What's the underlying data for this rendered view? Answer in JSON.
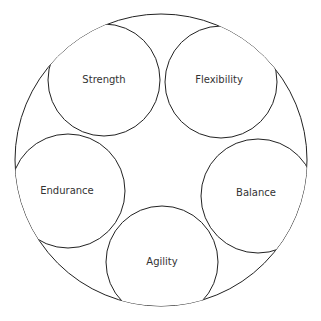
{
  "diagram": {
    "outer": {
      "cx": 161,
      "cy": 160,
      "r": 146
    },
    "nodes": [
      {
        "label": "Strength",
        "cx": 104,
        "cy": 80,
        "r": 56
      },
      {
        "label": "Flexibility",
        "cx": 221,
        "cy": 82,
        "r": 56
      },
      {
        "label": "Endurance",
        "cx": 68,
        "cy": 191,
        "r": 57
      },
      {
        "label": "Balance",
        "cx": 258,
        "cy": 196,
        "r": 57
      },
      {
        "label": "Agility",
        "cx": 162,
        "cy": 262,
        "r": 56
      }
    ],
    "stroke_color": "#222222"
  }
}
